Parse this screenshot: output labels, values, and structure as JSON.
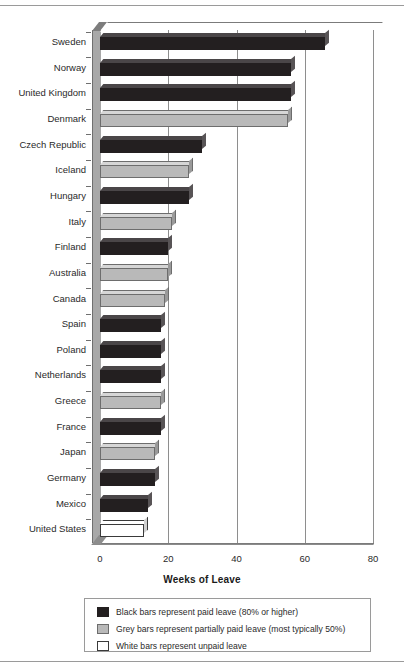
{
  "chart_data": {
    "type": "bar",
    "orientation": "horizontal",
    "title": "",
    "xlabel": "Weeks of Leave",
    "ylabel": "",
    "xlim": [
      0,
      80
    ],
    "xticks": [
      0,
      20,
      40,
      60,
      80
    ],
    "grid": true,
    "legend_position": "bottom",
    "categories": [
      "Sweden",
      "Norway",
      "United Kingdom",
      "Denmark",
      "Czech Republic",
      "Iceland",
      "Hungary",
      "Italy",
      "Finland",
      "Australia",
      "Canada",
      "Spain",
      "Poland",
      "Netherlands",
      "Greece",
      "France",
      "Japan",
      "Germany",
      "Mexico",
      "United States"
    ],
    "values": [
      66,
      56,
      56,
      55,
      30,
      26,
      26,
      21,
      20,
      20,
      19,
      18,
      18,
      18,
      18,
      18,
      16,
      16,
      14,
      13
    ],
    "bar_types": [
      "black",
      "black",
      "black",
      "grey",
      "black",
      "grey",
      "black",
      "grey",
      "black",
      "grey",
      "grey",
      "black",
      "black",
      "black",
      "grey",
      "black",
      "grey",
      "black",
      "black",
      "white"
    ],
    "series": [
      {
        "name": "Weeks of Leave",
        "points": [
          {
            "category": "Sweden",
            "value": 66,
            "type": "black"
          },
          {
            "category": "Norway",
            "value": 56,
            "type": "black"
          },
          {
            "category": "United Kingdom",
            "value": 56,
            "type": "black"
          },
          {
            "category": "Denmark",
            "value": 55,
            "type": "grey"
          },
          {
            "category": "Czech Republic",
            "value": 30,
            "type": "black"
          },
          {
            "category": "Iceland",
            "value": 26,
            "type": "grey"
          },
          {
            "category": "Hungary",
            "value": 26,
            "type": "black"
          },
          {
            "category": "Italy",
            "value": 21,
            "type": "grey"
          },
          {
            "category": "Finland",
            "value": 20,
            "type": "black"
          },
          {
            "category": "Australia",
            "value": 20,
            "type": "grey"
          },
          {
            "category": "Canada",
            "value": 19,
            "type": "grey"
          },
          {
            "category": "Spain",
            "value": 18,
            "type": "black"
          },
          {
            "category": "Poland",
            "value": 18,
            "type": "black"
          },
          {
            "category": "Netherlands",
            "value": 18,
            "type": "black"
          },
          {
            "category": "Greece",
            "value": 18,
            "type": "grey"
          },
          {
            "category": "France",
            "value": 18,
            "type": "black"
          },
          {
            "category": "Japan",
            "value": 16,
            "type": "grey"
          },
          {
            "category": "Germany",
            "value": 16,
            "type": "black"
          },
          {
            "category": "Mexico",
            "value": 14,
            "type": "black"
          },
          {
            "category": "United States",
            "value": 13,
            "type": "white"
          }
        ]
      }
    ],
    "legend": [
      {
        "swatch": "black",
        "label": "Black bars represent paid leave (80% or higher)"
      },
      {
        "swatch": "grey",
        "label": "Grey bars represent partially paid leave (most typically 50%)"
      },
      {
        "swatch": "white",
        "label": "White bars represent unpaid leave"
      }
    ]
  }
}
